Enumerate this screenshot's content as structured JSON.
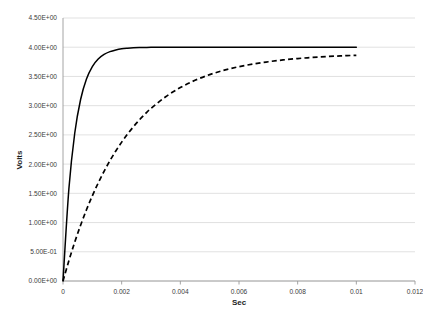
{
  "chart_data": {
    "type": "line",
    "title": "",
    "xlabel": "Sec",
    "ylabel": "Volts",
    "xlim": [
      0,
      0.012
    ],
    "ylim": [
      0,
      4.5
    ],
    "grid": "horizontal",
    "legend": "none",
    "xticks": [
      "0",
      "0.002",
      "0.004",
      "0.006",
      "0.008",
      "0.01",
      "0.012"
    ],
    "xtick_values": [
      0,
      0.002,
      0.004,
      0.006,
      0.008,
      0.01,
      0.012
    ],
    "yticks": [
      "0.00E+00",
      "5.00E-01",
      "1.00E+00",
      "1.50E+00",
      "2.00E+00",
      "2.50E+00",
      "3.00E+00",
      "3.50E+00",
      "4.00E+00",
      "4.50E+00"
    ],
    "ytick_values": [
      0,
      0.5,
      1.0,
      1.5,
      2.0,
      2.5,
      3.0,
      3.5,
      4.0,
      4.5
    ],
    "x": [
      0,
      0.0002,
      0.0004,
      0.0006,
      0.0008,
      0.001,
      0.0012,
      0.0014,
      0.0016,
      0.0018,
      0.002,
      0.0022,
      0.0024,
      0.0026,
      0.0028,
      0.003,
      0.0035,
      0.004,
      0.0045,
      0.005,
      0.0055,
      0.006,
      0.0065,
      0.007,
      0.0075,
      0.008,
      0.0085,
      0.009,
      0.0095,
      0.01
    ],
    "series": [
      {
        "name": "fast-rise",
        "style": "solid",
        "color": "#000000",
        "asymptote": 4.0,
        "tau": 0.0004,
        "values": [
          0.0,
          1.574,
          2.528,
          3.106,
          3.456,
          3.669,
          3.798,
          3.876,
          3.925,
          3.954,
          3.973,
          3.983,
          3.99,
          3.994,
          3.996,
          3.998,
          3.999,
          4.0,
          4.0,
          4.0,
          4.0,
          4.0,
          4.0,
          4.0,
          4.0,
          4.0,
          4.0,
          4.0,
          4.0,
          4.0
        ]
      },
      {
        "name": "slow-rise",
        "style": "dashed",
        "color": "#000000",
        "asymptote": 4.0,
        "tau": 0.0022,
        "values": [
          0.0,
          0.348,
          0.665,
          0.954,
          1.218,
          1.458,
          1.677,
          1.877,
          2.059,
          2.225,
          2.376,
          2.514,
          2.639,
          2.754,
          2.858,
          2.953,
          3.153,
          3.31,
          3.434,
          3.531,
          3.607,
          3.667,
          3.715,
          3.752,
          3.782,
          3.806,
          3.825,
          3.84,
          3.852,
          3.862
        ]
      }
    ]
  }
}
